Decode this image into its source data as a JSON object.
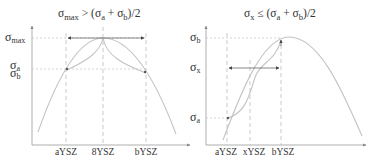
{
  "left_panel": {
    "title": {
      "sigma": "σ",
      "sub_main": "max",
      "relation": " > (",
      "sigma_a": "σ",
      "sub_a": "a",
      "plus": " + ",
      "sigma_b": "σ",
      "sub_b": "b",
      "tail": ")/2"
    },
    "y_labels": [
      {
        "sigma": "σ",
        "sub": "max"
      },
      {
        "sigma": "σ",
        "sub": "a"
      },
      {
        "sigma": "σ",
        "sub": "b"
      }
    ],
    "x_labels": [
      "aYSZ",
      "8YSZ",
      "bYSZ"
    ]
  },
  "right_panel": {
    "title": {
      "sigma": "σ",
      "sub_main": "x",
      "relation": " ≤ (",
      "sigma_a": "σ",
      "sub_a": "a",
      "plus": " + ",
      "sigma_b": "σ",
      "sub_b": "b",
      "tail": ")/2"
    },
    "y_labels": [
      {
        "sigma": "σ",
        "sub": "b"
      },
      {
        "sigma": "σ",
        "sub": "x"
      },
      {
        "sigma": "σ",
        "sub": "a"
      }
    ],
    "x_labels": [
      "aYSZ",
      "xYSZ",
      "bYSZ"
    ]
  },
  "colors": {
    "curve": "#c4c4c4",
    "axis": "#9a9a9a",
    "text": "#333333"
  }
}
